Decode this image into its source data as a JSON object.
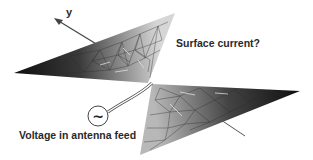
{
  "figure": {
    "type": "bowtie-antenna-mesh-diagram",
    "labels": {
      "axis_y": "y",
      "surface_current": "Surface current?",
      "voltage_feed": "Voltage in antenna feed"
    },
    "source_symbol": "~",
    "colors": {
      "background": "#ffffff",
      "mesh_dark": "#1a1a1a",
      "mesh_light": "#cfcfcf",
      "mesh_lines": "#3a3a3a",
      "text": "#2a2a2a"
    },
    "wings": {
      "upper": {
        "vertices": [
          [
            14,
            73
          ],
          [
            175,
            13
          ],
          [
            148,
            83
          ]
        ]
      },
      "lower": {
        "vertices": [
          [
            150,
            84
          ],
          [
            300,
            91
          ],
          [
            140,
            155
          ]
        ]
      }
    }
  }
}
